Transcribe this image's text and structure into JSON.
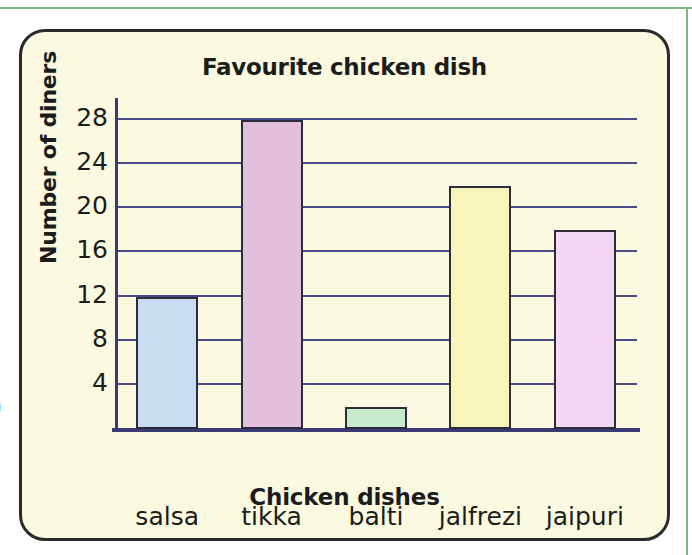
{
  "page": {
    "margin_glyph": ")",
    "rule_color": "#7cb97c"
  },
  "card": {
    "background": "#fbfae0",
    "border_color": "#2a2a2a"
  },
  "chart_data": {
    "type": "bar",
    "title": "Favourite chicken dish",
    "xlabel": "Chicken dishes",
    "ylabel": "Number of diners",
    "categories": [
      "salsa",
      "tikka",
      "balti",
      "jalfrezi",
      "jaipuri"
    ],
    "values": [
      12,
      28,
      2,
      22,
      18
    ],
    "bar_colors": [
      "#c9ddf2",
      "#e2bfda",
      "#c6ebcc",
      "#f8f5bb",
      "#f2d6f4"
    ],
    "bar_border_color": "#2c2c3c",
    "ylim": [
      0,
      30
    ],
    "yticks": [
      4,
      8,
      12,
      16,
      20,
      24,
      28
    ],
    "ytick_labels": [
      "4",
      "8",
      "12",
      "16",
      "20",
      "24",
      "28"
    ],
    "grid": true,
    "gridline_color": "#4a4a86",
    "axis_color": "#3a3a74",
    "legend": null
  }
}
